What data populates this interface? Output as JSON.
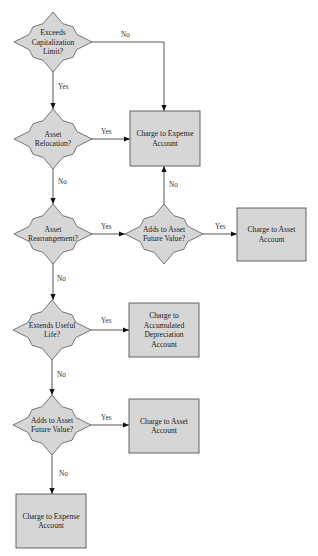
{
  "diagram": {
    "type": "flowchart",
    "nodes": [
      {
        "id": "d1",
        "kind": "decision",
        "lines": [
          "Exceeds",
          "Capitalization",
          "Limit?"
        ]
      },
      {
        "id": "d2",
        "kind": "decision",
        "lines": [
          "Asset",
          "Relocation?"
        ]
      },
      {
        "id": "d3",
        "kind": "decision",
        "lines": [
          "Asset",
          "Rearrangement?"
        ]
      },
      {
        "id": "d4",
        "kind": "decision",
        "lines": [
          "Adds to Asset",
          "Future Value?"
        ]
      },
      {
        "id": "d5",
        "kind": "decision",
        "lines": [
          "Extends Useful",
          "Life?"
        ]
      },
      {
        "id": "d6",
        "kind": "decision",
        "lines": [
          "Adds to Asset",
          "Future Value?"
        ]
      },
      {
        "id": "b1",
        "kind": "process",
        "lines": [
          "Charge to Expense",
          "Account"
        ]
      },
      {
        "id": "b2",
        "kind": "process",
        "lines": [
          "Charge to Asset",
          "Account"
        ]
      },
      {
        "id": "b3",
        "kind": "process",
        "lines": [
          "Charge to",
          "Accumulated",
          "Depreciation",
          "Account"
        ]
      },
      {
        "id": "b4",
        "kind": "process",
        "lines": [
          "Charge to Asset",
          "Account"
        ]
      },
      {
        "id": "b5",
        "kind": "process",
        "lines": [
          "Charge to Expense",
          "Account"
        ]
      }
    ],
    "edges": [
      {
        "from": "d1",
        "to": "b1",
        "label": "No"
      },
      {
        "from": "d1",
        "to": "d2",
        "label": "Yes"
      },
      {
        "from": "d2",
        "to": "b1",
        "label": "Yes"
      },
      {
        "from": "d2",
        "to": "d3",
        "label": "No"
      },
      {
        "from": "d3",
        "to": "d4",
        "label": "Yes"
      },
      {
        "from": "d4",
        "to": "b1",
        "label": "No"
      },
      {
        "from": "d4",
        "to": "b2",
        "label": "Yes"
      },
      {
        "from": "d3",
        "to": "d5",
        "label": "No"
      },
      {
        "from": "d5",
        "to": "b3",
        "label": "Yes"
      },
      {
        "from": "d5",
        "to": "d6",
        "label": "No"
      },
      {
        "from": "d6",
        "to": "b4",
        "label": "Yes"
      },
      {
        "from": "d6",
        "to": "b5",
        "label": "No"
      }
    ]
  }
}
